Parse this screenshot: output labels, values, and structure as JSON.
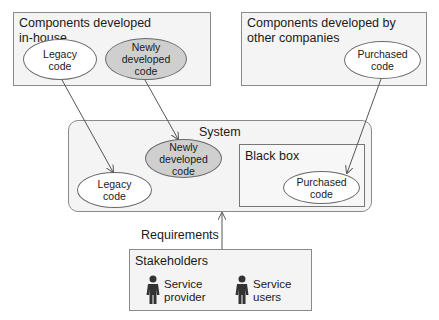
{
  "diagram": {
    "inhouse_group": {
      "title": "Components developed\nin-house",
      "title_line1": "Components developed",
      "title_line2": "in-house",
      "items": [
        {
          "label": "Legacy\ncode",
          "shade": "white"
        },
        {
          "label": "Newly\ndeveloped\ncode",
          "shade": "gray"
        }
      ]
    },
    "external_group": {
      "title_line1": "Components developed by",
      "title_line2": "other companies",
      "items": [
        {
          "label": "Purchased\ncode",
          "shade": "white"
        }
      ]
    },
    "system": {
      "title": "System",
      "items": [
        {
          "label": "Legacy\ncode",
          "shade": "white"
        },
        {
          "label": "Newly\ndeveloped\ncode",
          "shade": "gray"
        }
      ],
      "black_box": {
        "title": "Black box",
        "items": [
          {
            "label": "Purchased\ncode",
            "shade": "white"
          }
        ]
      }
    },
    "requirements_label": "Requirements",
    "stakeholders": {
      "title": "Stakeholders",
      "actors": [
        {
          "label": "Service\nprovider",
          "icon": "person-icon"
        },
        {
          "label": "Service\nusers",
          "icon": "person-icon"
        }
      ]
    },
    "colors": {
      "box_fill": "#f4f4f4",
      "box_border": "#8a8a8a",
      "ellipse_gray": "#cfcfcf",
      "arrow": "#555555",
      "person": "#333333"
    }
  }
}
